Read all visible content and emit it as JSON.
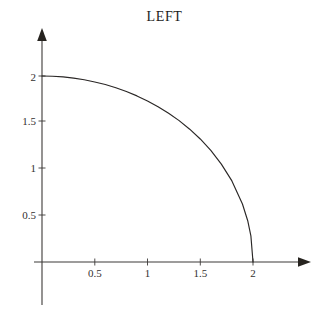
{
  "figure": {
    "title": "LEFT",
    "background_color": "#ffffff",
    "axis_color": "#3d3a38",
    "curve_color": "#2a2726",
    "text_color": "#33302f"
  },
  "chart_data": {
    "type": "line",
    "title": "LEFT",
    "xlabel": "",
    "ylabel": "",
    "xlim": [
      0,
      2.55
    ],
    "ylim": [
      0,
      2.5
    ],
    "grid": false,
    "legend": null,
    "x_ticks": [
      0.5,
      1,
      1.5,
      2
    ],
    "x_tick_labels": [
      "0.5",
      "1",
      "1.5",
      "2"
    ],
    "y_ticks": [
      0.5,
      1,
      1.5,
      2
    ],
    "y_tick_labels": [
      "0.5",
      "1",
      "1.5",
      "2"
    ],
    "series": [
      {
        "name": "x^2 + y^2 = 4",
        "x": [
          0,
          0.1,
          0.2,
          0.3,
          0.4,
          0.5,
          0.6,
          0.7,
          0.8,
          0.9,
          1.0,
          1.1,
          1.2,
          1.3,
          1.4,
          1.5,
          1.6,
          1.7,
          1.8,
          1.9,
          1.95,
          1.98,
          2.0
        ],
        "y": [
          2.0,
          1.997,
          1.99,
          1.977,
          1.96,
          1.936,
          1.908,
          1.874,
          1.833,
          1.786,
          1.732,
          1.67,
          1.6,
          1.52,
          1.428,
          1.323,
          1.2,
          1.053,
          0.872,
          0.624,
          0.444,
          0.281,
          0.0
        ]
      }
    ]
  },
  "axes": {
    "x_axis_name": "x-axis",
    "y_axis_name": "y-axis",
    "x_arrow": "arrow-right",
    "y_arrow": "arrow-up"
  }
}
